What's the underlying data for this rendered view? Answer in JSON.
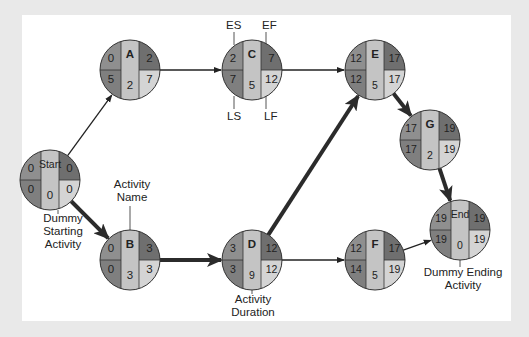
{
  "colors": {
    "background": "#e9e9e9",
    "panel": "#ffffff",
    "es_cell": "#8f8f8f",
    "ef_cell": "#6f6f6f",
    "ls_cell": "#7f7f7f",
    "lf_cell": "#d4d4d4",
    "name_col": "#c4c4c4",
    "stroke": "#333333",
    "critical_arrow": "#2b2b2b"
  },
  "nodes": [
    {
      "id": "start",
      "name": "Start",
      "es": "0",
      "ef": "0",
      "ls": "0",
      "lf": "0",
      "duration": "0",
      "cx": 50,
      "cy": 180
    },
    {
      "id": "A",
      "name": "A",
      "es": "0",
      "ef": "2",
      "ls": "5",
      "lf": "7",
      "duration": "2",
      "cx": 130,
      "cy": 70
    },
    {
      "id": "B",
      "name": "B",
      "es": "0",
      "ef": "3",
      "ls": "0",
      "lf": "3",
      "duration": "3",
      "cx": 130,
      "cy": 260
    },
    {
      "id": "C",
      "name": "C",
      "es": "2",
      "ef": "7",
      "ls": "7",
      "lf": "12",
      "duration": "5",
      "cx": 252,
      "cy": 70
    },
    {
      "id": "D",
      "name": "D",
      "es": "3",
      "ef": "12",
      "ls": "3",
      "lf": "12",
      "duration": "9",
      "cx": 252,
      "cy": 260
    },
    {
      "id": "E",
      "name": "E",
      "es": "12",
      "ef": "17",
      "ls": "12",
      "lf": "17",
      "duration": "5",
      "cx": 375,
      "cy": 70
    },
    {
      "id": "F",
      "name": "F",
      "es": "12",
      "ef": "17",
      "ls": "14",
      "lf": "19",
      "duration": "5",
      "cx": 375,
      "cy": 260
    },
    {
      "id": "G",
      "name": "G",
      "es": "17",
      "ef": "19",
      "ls": "17",
      "lf": "19",
      "duration": "2",
      "cx": 430,
      "cy": 140
    },
    {
      "id": "end",
      "name": "End",
      "es": "19",
      "ef": "19",
      "ls": "19",
      "lf": "19",
      "duration": "0",
      "cx": 460,
      "cy": 230
    }
  ],
  "edges": [
    {
      "from": "start",
      "to": "A",
      "critical": false
    },
    {
      "from": "start",
      "to": "B",
      "critical": true
    },
    {
      "from": "A",
      "to": "C",
      "critical": false
    },
    {
      "from": "B",
      "to": "D",
      "critical": true
    },
    {
      "from": "C",
      "to": "E",
      "critical": false
    },
    {
      "from": "D",
      "to": "E",
      "critical": true
    },
    {
      "from": "D",
      "to": "F",
      "critical": false
    },
    {
      "from": "E",
      "to": "G",
      "critical": true
    },
    {
      "from": "F",
      "to": "end",
      "critical": false
    },
    {
      "from": "G",
      "to": "end",
      "critical": true
    }
  ],
  "annotations": {
    "es": "ES",
    "ef": "EF",
    "ls": "LS",
    "lf": "LF",
    "activity_name_1": "Activity",
    "activity_name_2": "Name",
    "activity_duration_1": "Activity",
    "activity_duration_2": "Duration",
    "dummy_start_1": "Dummy",
    "dummy_start_2": "Starting",
    "dummy_start_3": "Activity",
    "dummy_end_1": "Dummy Ending",
    "dummy_end_2": "Activity"
  }
}
